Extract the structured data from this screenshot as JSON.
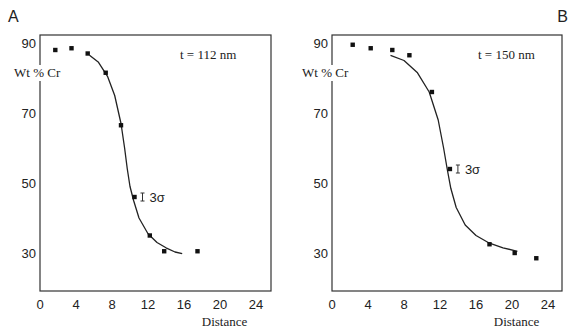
{
  "chart_data": [
    {
      "type": "scatter",
      "panel_label": "A",
      "annotation": "t = 112 nm",
      "error_label": "3σ",
      "xlabel": "Distance",
      "ylabel": "Wt % Cr",
      "xticks": [
        0,
        4,
        8,
        12,
        16,
        20,
        24
      ],
      "yticks": [
        30,
        50,
        70,
        90
      ],
      "xlim": [
        0,
        25.5
      ],
      "ylim": [
        20,
        92
      ],
      "grid": false,
      "points": {
        "x": [
          1.7,
          3.5,
          5.3,
          7.3,
          9.0,
          10.5,
          12.2,
          13.8,
          17.5
        ],
        "y": [
          88,
          88.5,
          87,
          81.5,
          66.5,
          46,
          35,
          30.5,
          30.5
        ]
      },
      "fit_curve": {
        "x": [
          5.5,
          6.5,
          7.5,
          8.3,
          9.0,
          9.4,
          9.7,
          10.0,
          10.4,
          11.0,
          12.0,
          13.0,
          14.0,
          15.0,
          15.8
        ],
        "y": [
          86.5,
          84.5,
          80.5,
          75,
          67,
          60,
          54,
          49,
          45,
          40,
          35.5,
          33,
          31.5,
          30.3,
          29.8
        ]
      }
    },
    {
      "type": "scatter",
      "panel_label": "B",
      "annotation": "t = 150 nm",
      "error_label": "3σ",
      "xlabel": "Distance",
      "ylabel": "Wt % Cr",
      "xticks": [
        0,
        4,
        8,
        12,
        16,
        20,
        24
      ],
      "yticks": [
        30,
        50,
        70,
        90
      ],
      "xlim": [
        0,
        25.5
      ],
      "ylim": [
        20,
        92
      ],
      "grid": false,
      "points": {
        "x": [
          2.3,
          4.3,
          6.7,
          8.6,
          11.1,
          13.1,
          17.5,
          20.3,
          22.7
        ],
        "y": [
          89.5,
          88.5,
          88,
          86.5,
          76,
          54,
          32.5,
          30,
          28.5
        ]
      },
      "fit_curve": {
        "x": [
          6.5,
          8.0,
          9.5,
          10.8,
          11.8,
          12.4,
          12.8,
          13.2,
          13.8,
          14.8,
          16.0,
          17.5,
          19.0,
          20.6
        ],
        "y": [
          86.5,
          85,
          81.5,
          76,
          68,
          60,
          54,
          48.5,
          43,
          38,
          35,
          32.8,
          31.5,
          30.5
        ]
      }
    }
  ]
}
